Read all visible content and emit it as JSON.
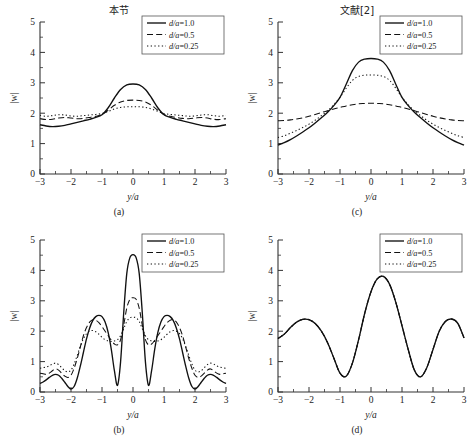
{
  "figure": {
    "column_titles": [
      "本节",
      "文献[2]"
    ],
    "panels": [
      {
        "id": "a",
        "caption": "(a)",
        "column_title": "本节"
      },
      {
        "id": "c",
        "caption": "(c)",
        "column_title": "文献[2]"
      },
      {
        "id": "b",
        "caption": "(b)",
        "column_title": ""
      },
      {
        "id": "d",
        "caption": "(d)",
        "column_title": ""
      }
    ]
  },
  "axes": {
    "xlabel": "y/a",
    "ylabel": "|w|",
    "xticks": [
      "-3",
      "-2",
      "-1",
      "0",
      "1",
      "2",
      "3"
    ],
    "yticks": [
      "0",
      "1",
      "2",
      "3",
      "4",
      "5"
    ],
    "xlim": [
      -3,
      3
    ],
    "ylim": [
      0,
      5
    ]
  },
  "legend": {
    "entries": [
      {
        "label": "d/a=1.0",
        "style": "solid"
      },
      {
        "label": "d/a=0.5",
        "style": "dashed"
      },
      {
        "label": "d/a=0.25",
        "style": "dotted"
      }
    ]
  },
  "chart_data": [
    {
      "id": "a",
      "type": "line",
      "title": "本节",
      "caption": "(a)",
      "xlabel": "y/a",
      "ylabel": "|w|",
      "xlim": [
        -3,
        3
      ],
      "ylim": [
        0,
        5
      ],
      "grid": false,
      "legend_position": "top-right",
      "x": [
        -3,
        -2.8,
        -2.6,
        -2.4,
        -2.2,
        -2,
        -1.8,
        -1.6,
        -1.4,
        -1.2,
        -1,
        -0.8,
        -0.6,
        -0.4,
        -0.2,
        0,
        0.2,
        0.4,
        0.6,
        0.8,
        1,
        1.2,
        1.4,
        1.6,
        1.8,
        2,
        2.2,
        2.4,
        2.6,
        2.8,
        3
      ],
      "series": [
        {
          "name": "d/a=1.0",
          "style": "solid",
          "values": [
            1.62,
            1.58,
            1.56,
            1.57,
            1.6,
            1.65,
            1.7,
            1.75,
            1.8,
            1.86,
            1.95,
            2.18,
            2.5,
            2.78,
            2.93,
            2.96,
            2.93,
            2.78,
            2.5,
            2.18,
            1.95,
            1.86,
            1.8,
            1.75,
            1.7,
            1.65,
            1.6,
            1.57,
            1.56,
            1.58,
            1.62
          ]
        },
        {
          "name": "d/a=0.5",
          "style": "dashed",
          "values": [
            1.82,
            1.79,
            1.8,
            1.84,
            1.86,
            1.84,
            1.82,
            1.83,
            1.86,
            1.9,
            1.96,
            2.1,
            2.26,
            2.37,
            2.42,
            2.43,
            2.42,
            2.37,
            2.26,
            2.1,
            1.96,
            1.9,
            1.86,
            1.83,
            1.82,
            1.84,
            1.86,
            1.84,
            1.8,
            1.79,
            1.82
          ]
        },
        {
          "name": "d/a=0.25",
          "style": "dotted",
          "values": [
            1.93,
            1.9,
            1.92,
            1.95,
            1.94,
            1.91,
            1.9,
            1.92,
            1.94,
            1.96,
            1.99,
            2.06,
            2.14,
            2.19,
            2.21,
            2.21,
            2.21,
            2.19,
            2.14,
            2.06,
            1.99,
            1.96,
            1.94,
            1.92,
            1.9,
            1.91,
            1.94,
            1.95,
            1.92,
            1.9,
            1.93
          ]
        }
      ]
    },
    {
      "id": "c",
      "type": "line",
      "title": "文献[2]",
      "caption": "(c)",
      "xlabel": "y/a",
      "ylabel": "|w|",
      "xlim": [
        -3,
        3
      ],
      "ylim": [
        0,
        5
      ],
      "grid": false,
      "legend_position": "top-right",
      "x": [
        -3,
        -2.8,
        -2.6,
        -2.4,
        -2.2,
        -2,
        -1.8,
        -1.6,
        -1.4,
        -1.2,
        -1,
        -0.8,
        -0.6,
        -0.4,
        -0.2,
        0,
        0.2,
        0.4,
        0.6,
        0.8,
        1,
        1.2,
        1.4,
        1.6,
        1.8,
        2,
        2.2,
        2.4,
        2.6,
        2.8,
        3
      ],
      "series": [
        {
          "name": "d/a=1.0",
          "style": "solid",
          "values": [
            0.95,
            1.03,
            1.13,
            1.25,
            1.38,
            1.52,
            1.68,
            1.85,
            2.03,
            2.25,
            2.52,
            2.95,
            3.4,
            3.68,
            3.78,
            3.8,
            3.78,
            3.68,
            3.4,
            2.95,
            2.52,
            2.25,
            2.03,
            1.85,
            1.68,
            1.52,
            1.38,
            1.25,
            1.13,
            1.03,
            0.95
          ]
        },
        {
          "name": "d/a=0.5",
          "style": "dashed",
          "values": [
            1.75,
            1.76,
            1.78,
            1.81,
            1.85,
            1.9,
            1.96,
            2.02,
            2.08,
            2.14,
            2.19,
            2.24,
            2.28,
            2.31,
            2.32,
            2.33,
            2.32,
            2.31,
            2.28,
            2.24,
            2.19,
            2.14,
            2.08,
            2.02,
            1.96,
            1.9,
            1.85,
            1.81,
            1.78,
            1.76,
            1.75
          ]
        },
        {
          "name": "d/a=0.25",
          "style": "dotted",
          "values": [
            1.2,
            1.26,
            1.34,
            1.43,
            1.53,
            1.64,
            1.77,
            1.92,
            2.08,
            2.28,
            2.52,
            2.82,
            3.08,
            3.21,
            3.25,
            3.26,
            3.25,
            3.21,
            3.08,
            2.82,
            2.52,
            2.28,
            2.08,
            1.92,
            1.77,
            1.64,
            1.53,
            1.43,
            1.34,
            1.26,
            1.2
          ]
        }
      ]
    },
    {
      "id": "b",
      "type": "line",
      "title": "",
      "caption": "(b)",
      "xlabel": "y/a",
      "ylabel": "|w|",
      "xlim": [
        -3,
        3
      ],
      "ylim": [
        0,
        5
      ],
      "grid": false,
      "legend_position": "top-right",
      "x": [
        -3,
        -2.9,
        -2.8,
        -2.7,
        -2.6,
        -2.5,
        -2.4,
        -2.3,
        -2.2,
        -2.1,
        -2,
        -1.9,
        -1.8,
        -1.7,
        -1.6,
        -1.5,
        -1.4,
        -1.3,
        -1.2,
        -1.1,
        -1,
        -0.9,
        -0.8,
        -0.7,
        -0.6,
        -0.5,
        -0.4,
        -0.3,
        -0.2,
        -0.1,
        0,
        0.1,
        0.2,
        0.3,
        0.4,
        0.5,
        0.6,
        0.7,
        0.8,
        0.9,
        1,
        1.1,
        1.2,
        1.3,
        1.4,
        1.5,
        1.6,
        1.7,
        1.8,
        1.9,
        2,
        2.1,
        2.2,
        2.3,
        2.4,
        2.5,
        2.6,
        2.7,
        2.8,
        2.9,
        3
      ],
      "series": [
        {
          "name": "d/a=1.0",
          "style": "solid",
          "values": [
            0.28,
            0.33,
            0.4,
            0.48,
            0.55,
            0.58,
            0.55,
            0.45,
            0.32,
            0.18,
            0.1,
            0.18,
            0.45,
            0.85,
            1.3,
            1.75,
            2.1,
            2.35,
            2.48,
            2.52,
            2.48,
            2.3,
            1.95,
            1.4,
            0.7,
            0.22,
            1.0,
            2.6,
            3.9,
            4.42,
            4.52,
            4.42,
            3.9,
            2.6,
            1.0,
            0.22,
            0.7,
            1.4,
            1.95,
            2.3,
            2.48,
            2.52,
            2.48,
            2.35,
            2.1,
            1.75,
            1.3,
            0.85,
            0.45,
            0.18,
            0.1,
            0.18,
            0.32,
            0.45,
            0.55,
            0.58,
            0.55,
            0.48,
            0.4,
            0.33,
            0.28
          ]
        },
        {
          "name": "d/a=0.5",
          "style": "dashed",
          "values": [
            0.62,
            0.6,
            0.58,
            0.62,
            0.7,
            0.76,
            0.72,
            0.62,
            0.52,
            0.48,
            0.55,
            0.78,
            1.1,
            1.48,
            1.85,
            2.12,
            2.3,
            2.38,
            2.36,
            2.28,
            2.15,
            2.0,
            1.85,
            1.7,
            1.58,
            1.55,
            1.72,
            2.2,
            2.76,
            3.05,
            3.1,
            3.05,
            2.76,
            2.2,
            1.72,
            1.55,
            1.58,
            1.7,
            1.85,
            2.0,
            2.15,
            2.28,
            2.36,
            2.38,
            2.3,
            2.12,
            1.85,
            1.48,
            1.1,
            0.78,
            0.55,
            0.48,
            0.52,
            0.62,
            0.72,
            0.76,
            0.7,
            0.62,
            0.58,
            0.6,
            0.62
          ]
        },
        {
          "name": "d/a=0.25",
          "style": "dotted",
          "values": [
            0.78,
            0.8,
            0.82,
            0.86,
            0.92,
            0.95,
            0.9,
            0.8,
            0.7,
            0.66,
            0.72,
            0.92,
            1.2,
            1.5,
            1.75,
            1.92,
            2.0,
            2.02,
            1.98,
            1.9,
            1.8,
            1.72,
            1.68,
            1.66,
            1.68,
            1.72,
            1.85,
            2.08,
            2.32,
            2.44,
            2.46,
            2.44,
            2.32,
            2.08,
            1.85,
            1.72,
            1.68,
            1.66,
            1.68,
            1.72,
            1.8,
            1.9,
            1.98,
            2.02,
            2.0,
            1.92,
            1.75,
            1.5,
            1.2,
            0.92,
            0.72,
            0.66,
            0.7,
            0.8,
            0.9,
            0.95,
            0.92,
            0.86,
            0.82,
            0.8,
            0.78
          ]
        }
      ]
    },
    {
      "id": "d",
      "type": "line",
      "title": "",
      "caption": "(d)",
      "xlabel": "y/a",
      "ylabel": "|w|",
      "xlim": [
        -3,
        3
      ],
      "ylim": [
        0,
        5
      ],
      "grid": false,
      "legend_position": "top-right",
      "note": "all three curves coincide",
      "x": [
        -3,
        -2.8,
        -2.6,
        -2.4,
        -2.2,
        -2,
        -1.8,
        -1.6,
        -1.4,
        -1.2,
        -1,
        -0.8,
        -0.6,
        -0.4,
        -0.2,
        0,
        0.2,
        0.4,
        0.6,
        0.8,
        1,
        1.2,
        1.4,
        1.6,
        1.8,
        2,
        2.2,
        2.4,
        2.6,
        2.8,
        3
      ],
      "series": [
        {
          "name": "d/a=1.0",
          "style": "solid",
          "values": [
            1.76,
            1.9,
            2.12,
            2.3,
            2.39,
            2.38,
            2.25,
            2.0,
            1.62,
            1.12,
            0.62,
            0.52,
            0.95,
            1.72,
            2.6,
            3.3,
            3.72,
            3.8,
            3.54,
            2.95,
            2.18,
            1.4,
            0.72,
            0.5,
            0.8,
            1.4,
            2.0,
            2.32,
            2.4,
            2.26,
            1.78
          ]
        },
        {
          "name": "d/a=0.5",
          "style": "dashed",
          "values": [
            1.76,
            1.9,
            2.12,
            2.3,
            2.39,
            2.38,
            2.25,
            2.0,
            1.62,
            1.12,
            0.62,
            0.52,
            0.95,
            1.72,
            2.6,
            3.3,
            3.72,
            3.8,
            3.54,
            2.95,
            2.18,
            1.4,
            0.72,
            0.5,
            0.8,
            1.4,
            2.0,
            2.32,
            2.4,
            2.26,
            1.78
          ]
        },
        {
          "name": "d/a=0.25",
          "style": "dotted",
          "values": [
            1.76,
            1.9,
            2.12,
            2.3,
            2.39,
            2.38,
            2.25,
            2.0,
            1.62,
            1.12,
            0.62,
            0.52,
            0.95,
            1.72,
            2.6,
            3.3,
            3.72,
            3.8,
            3.54,
            2.95,
            2.18,
            1.4,
            0.72,
            0.5,
            0.8,
            1.4,
            2.0,
            2.32,
            2.4,
            2.26,
            1.78
          ]
        }
      ]
    }
  ]
}
